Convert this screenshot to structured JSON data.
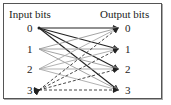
{
  "diagram": {
    "input_title": "Input bits",
    "output_title": "Output bits",
    "inputs": [
      "0",
      "1",
      "2",
      "3"
    ],
    "outputs": [
      "0",
      "1",
      "2",
      "3"
    ],
    "edge_styles": {
      "0": {
        "style": "solid",
        "color": "#222222"
      },
      "1": {
        "style": "solid",
        "color": "#9a9a9a"
      },
      "2": {
        "style": "solid",
        "color": "#a8a8a8"
      },
      "3": {
        "style": "dashed",
        "color": "#333333"
      }
    },
    "edges": [
      {
        "from": "0",
        "to": "0"
      },
      {
        "from": "0",
        "to": "1"
      },
      {
        "from": "0",
        "to": "2"
      },
      {
        "from": "0",
        "to": "3"
      },
      {
        "from": "1",
        "to": "0"
      },
      {
        "from": "1",
        "to": "1"
      },
      {
        "from": "1",
        "to": "2"
      },
      {
        "from": "1",
        "to": "3"
      },
      {
        "from": "2",
        "to": "0"
      },
      {
        "from": "2",
        "to": "1"
      },
      {
        "from": "2",
        "to": "2"
      },
      {
        "from": "2",
        "to": "3"
      },
      {
        "from": "3",
        "to": "0"
      },
      {
        "from": "3",
        "to": "1"
      },
      {
        "from": "3",
        "to": "2"
      },
      {
        "from": "3",
        "to": "3"
      }
    ]
  }
}
